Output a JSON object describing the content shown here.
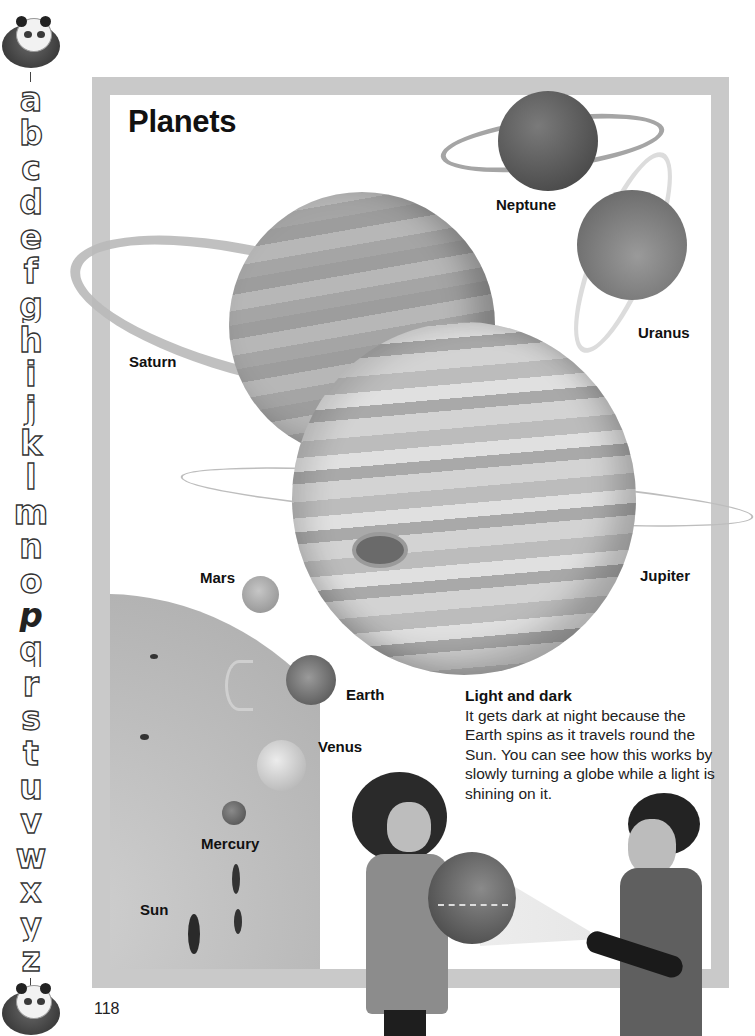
{
  "page": {
    "title": "Planets",
    "page_number": "118"
  },
  "alphabet_strip": {
    "letters": [
      "a",
      "b",
      "c",
      "d",
      "e",
      "f",
      "g",
      "h",
      "i",
      "j",
      "k",
      "l",
      "m",
      "n",
      "o",
      "p",
      "q",
      "r",
      "s",
      "t",
      "u",
      "v",
      "w",
      "x",
      "y",
      "z"
    ],
    "active_letter": "p",
    "top_icon": "panda-icon",
    "bottom_icon": "panda-icon"
  },
  "planets": {
    "neptune": {
      "label": "Neptune",
      "color": "#5a5a5a"
    },
    "uranus": {
      "label": "Uranus",
      "color": "#8a8a8a"
    },
    "saturn": {
      "label": "Saturn",
      "color": "#a6a6a6"
    },
    "jupiter": {
      "label": "Jupiter",
      "color": "#c4c4c4"
    },
    "mars": {
      "label": "Mars",
      "color": "#b0b0b0"
    },
    "earth": {
      "label": "Earth",
      "color": "#777777"
    },
    "venus": {
      "label": "Venus",
      "color": "#d0d0d0"
    },
    "mercury": {
      "label": "Mercury",
      "color": "#707070"
    },
    "sun": {
      "label": "Sun",
      "color": "#b5b5b5"
    }
  },
  "info_box": {
    "heading": "Light and dark",
    "body": "It gets dark at night because the Earth spins as it travels round the Sun. You can see how this works by slowly turning a globe while a light is shining on it."
  },
  "colors": {
    "frame": "#c9c9c9",
    "background": "#ffffff",
    "text": "#111111"
  }
}
